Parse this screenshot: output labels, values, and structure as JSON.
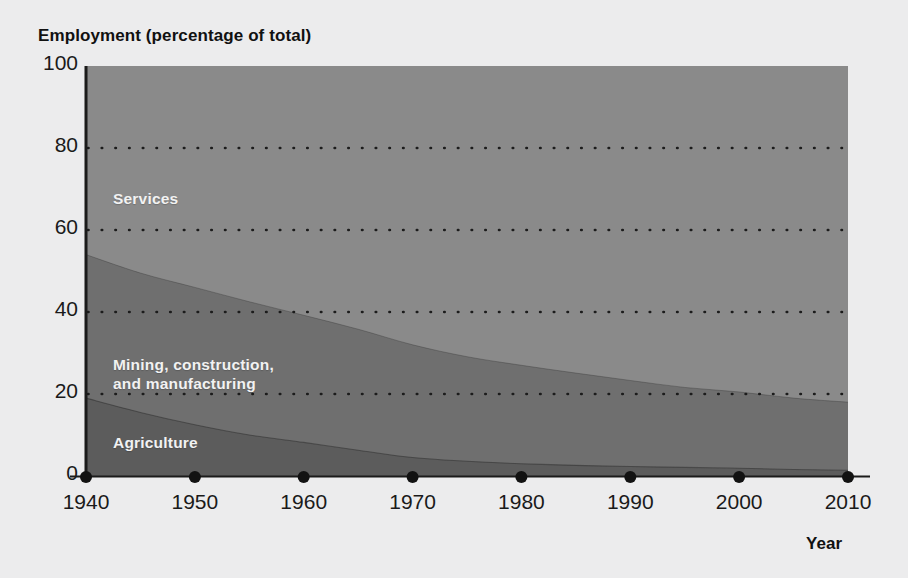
{
  "figure": {
    "background_color": "#ececed",
    "y_axis_title": "Employment (percentage of total)",
    "x_axis_title": "Year",
    "y_ticks": [
      "100",
      "80",
      "60",
      "40",
      "20",
      "0"
    ],
    "x_ticks": [
      "1940",
      "1950",
      "1960",
      "1970",
      "1980",
      "1990",
      "2000",
      "2010"
    ],
    "series_labels": {
      "services": "Services",
      "manufacturing": "Mining, construction,\nand manufacturing",
      "agriculture": "Agriculture"
    },
    "colors": {
      "services": "#8a8a8a",
      "manufacturing": "#6f6f6f",
      "agriculture": "#5c5c5c",
      "gridline": "#1b1b1b",
      "axis": "#1b1b1b",
      "label_text": "#f2f2f2",
      "tick_text": "#1a1a1a"
    }
  },
  "chart_data": {
    "type": "area",
    "title": "",
    "subtitle": "",
    "xlabel": "Year",
    "ylabel": "Employment (percentage of total)",
    "xlim": [
      1940,
      2010
    ],
    "ylim": [
      0,
      100
    ],
    "grid": true,
    "gridlines_y": [
      20,
      40,
      60,
      80
    ],
    "legend_position": "inline-area-labels",
    "stacked": true,
    "x": [
      1940,
      1945,
      1950,
      1955,
      1960,
      1965,
      1970,
      1975,
      1980,
      1985,
      1990,
      1995,
      2000,
      2005,
      2010
    ],
    "series": [
      {
        "name": "Agriculture",
        "color": "#5c5c5c",
        "values": [
          19.0,
          15.5,
          12.5,
          10.0,
          8.2,
          6.3,
          4.5,
          3.6,
          3.0,
          2.6,
          2.3,
          2.1,
          1.9,
          1.6,
          1.4
        ]
      },
      {
        "name": "Mining, construction, and manufacturing",
        "color": "#6f6f6f",
        "values": [
          35.0,
          34.0,
          33.5,
          32.5,
          31.0,
          29.5,
          27.5,
          25.5,
          24.0,
          22.5,
          21.0,
          19.5,
          18.6,
          17.4,
          16.6
        ]
      },
      {
        "name": "Services",
        "color": "#8a8a8a",
        "values": [
          46.0,
          50.5,
          54.0,
          57.5,
          60.8,
          64.2,
          68.0,
          70.9,
          73.0,
          74.9,
          76.7,
          78.4,
          79.5,
          81.0,
          82.0
        ]
      }
    ],
    "cumulative_top_boundaries": {
      "agriculture_top": [
        19.0,
        15.5,
        12.5,
        10.0,
        8.2,
        6.3,
        4.5,
        3.6,
        3.0,
        2.6,
        2.3,
        2.1,
        1.9,
        1.6,
        1.4
      ],
      "manufacturing_top": [
        54.0,
        49.5,
        46.0,
        42.5,
        39.2,
        35.8,
        32.0,
        29.1,
        27.0,
        25.1,
        23.3,
        21.6,
        20.5,
        19.0,
        18.0
      ]
    }
  }
}
